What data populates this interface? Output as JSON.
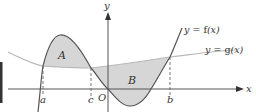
{
  "figure": {
    "type": "area-between-curves",
    "axes": {
      "x_label": "x",
      "y_label": "y",
      "origin_label": "O"
    },
    "curves": [
      {
        "name": "f",
        "label": "y = f(x)",
        "label_prefix": "y = ",
        "label_fn": "f",
        "label_arg": "(x)"
      },
      {
        "name": "g",
        "label": "y = g(x)",
        "label_prefix": "y = ",
        "label_fn": "g",
        "label_arg": "(x)"
      }
    ],
    "regions": [
      {
        "label": "A",
        "from": "a",
        "to": "c",
        "upper": "f",
        "lower": "g"
      },
      {
        "label": "B",
        "from": "c",
        "to": "b",
        "upper": "g",
        "lower": "f"
      }
    ],
    "x_markers": [
      "a",
      "c",
      "b"
    ],
    "colors": {
      "axis": "#555555",
      "f_curve": "#555555",
      "g_curve": "#b8b8b8",
      "region_fill": "#d6d6d6",
      "dashed": "#666666",
      "side_bar": "#333333"
    }
  }
}
